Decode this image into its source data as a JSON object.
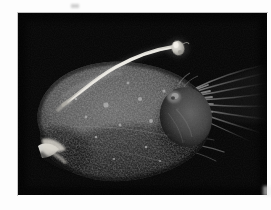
{
  "image": {
    "subject": "deep-sea anglerfish",
    "scene_description": "A whole deep-sea anglerfish specimen photographed against a solid black background. The bulbous, globular body fills the left and centre of the frame, its skin dark grey and densely covered in small warty tubercles. A long pale illicium (fishing rod) rises from the top of the head and arcs up to the right, ending in a bright bulbous esca (lure). A bright white jaw with teeth is visible at the lower-left. Thin translucent caudal fin rays fan outward to the right.",
    "orientation": "fish faces left, tail to the right",
    "background_color": "#050505",
    "border_color": "#fdfdfd",
    "anatomy_labels": [
      "illicium",
      "esca",
      "eye",
      "jaw",
      "tubercled-skin",
      "pectoral-fin",
      "caudal-fin-rays"
    ],
    "palette": {
      "background_black": "#050505",
      "body_dark_grey": "#3a3a3a",
      "body_mid_grey": "#5c5c5c",
      "body_highlight": "#8a8a8a",
      "illicium_white": "#e8e6e0",
      "esca_white": "#cfcdc7",
      "jaw_white": "#efefe9",
      "fin_ray_grey": "#6e6e6e",
      "margin_white": "#fdfdfd",
      "plate_edge": "#c9c9c9"
    },
    "plate": {
      "left": 18,
      "top": 13,
      "width": 249,
      "height": 182
    }
  }
}
